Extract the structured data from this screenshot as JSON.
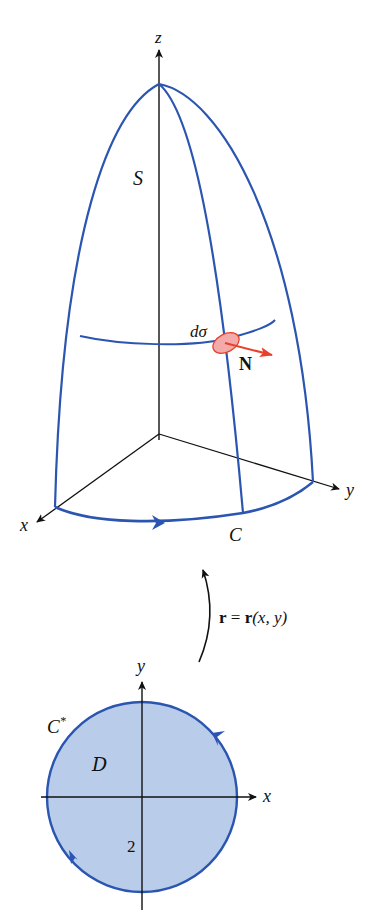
{
  "figure": {
    "surface": {
      "axis_labels": {
        "z": "z",
        "x": "x",
        "y": "y"
      },
      "surface_label": "S",
      "boundary_label": "C",
      "area_element_label": "dσ",
      "normal_label": "N"
    },
    "mapping": {
      "label_r": "r",
      "label_eq": " = ",
      "label_rhs": "r",
      "label_args": "(x, y)"
    },
    "domain_region": {
      "axis_labels": {
        "x": "x",
        "y": "y"
      },
      "region_label": "D",
      "boundary_label": "C",
      "boundary_superscript": "*",
      "radius_label": "2"
    },
    "colors": {
      "curve_blue": "#2a55b0",
      "axis_black": "#111111",
      "normal_red": "#e8402a",
      "patch_fill": "#f4aaaa",
      "disk_fill": "#b9cdea"
    }
  }
}
